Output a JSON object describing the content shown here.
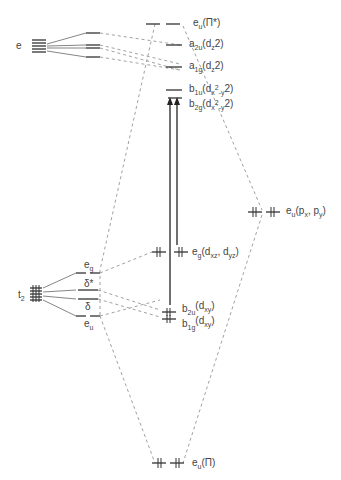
{
  "diagram": {
    "left_terms": {
      "e": "e",
      "t2": "t",
      "t2_sub": "2"
    },
    "left_split_labels": {
      "eg": "e",
      "eg_sub": "g",
      "delta_star": "δ*",
      "delta": "δ",
      "eu": "e",
      "eu_sub": "u"
    },
    "center_levels": [
      {
        "name": "e_u(pi*)",
        "sym": "e",
        "sym_sub": "u",
        "orb": "(Π*)"
      },
      {
        "name": "a_2u(dz2)",
        "sym": "a",
        "sym_sub": "2u",
        "orb": "(d",
        "orb_sub": "z",
        "orb_end": "2)"
      },
      {
        "name": "a_1g(dz2)",
        "sym": "a",
        "sym_sub": "1g",
        "orb": "(d",
        "orb_sub": "z",
        "orb_end": "2)"
      },
      {
        "name": "b_1u(dx2-y2)",
        "sym": "b",
        "sym_sub": "1u",
        "orb": "(d",
        "orb_sub": "x",
        "orb_end": "2",
        "orb_sub2": "-y",
        "orb_end2": "2)"
      },
      {
        "name": "b_2g(dx2-y2)",
        "sym": "b",
        "sym_sub": "2g",
        "orb": "(d",
        "orb_sub": "x",
        "orb_end": "2",
        "orb_sub2": "-y",
        "orb_end2": "2)"
      },
      {
        "name": "e_g(dxz,dyz)",
        "sym": "e",
        "sym_sub": "g",
        "orb": "(d",
        "orb_sub": "xz",
        "orb_mid": ", d",
        "orb_sub2": "yz",
        "orb_end2": ")"
      },
      {
        "name": "b_2u(dxy)",
        "sym": "b",
        "sym_sub": "2u",
        "orb": "(d",
        "orb_sub": "xy",
        "orb_end": ")"
      },
      {
        "name": "b_1g(dxy)",
        "sym": "b",
        "sym_sub": "1g",
        "orb": "(d",
        "orb_sub": "xy",
        "orb_end": ")"
      },
      {
        "name": "e_u(pi)",
        "sym": "e",
        "sym_sub": "u",
        "orb": "(Π)"
      }
    ],
    "right_level": {
      "name": "e_u(px,py)",
      "sym": "e",
      "sym_sub": "u",
      "orb": "(p",
      "orb_sub": "x",
      "orb_mid": ", p",
      "orb_sub2": "y",
      "orb_end2": ")"
    }
  }
}
